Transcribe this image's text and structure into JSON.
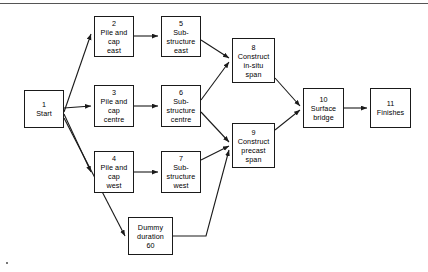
{
  "diagram": {
    "top_rule": true,
    "line_color": "#1a1a1a",
    "box_border_color": "#1a1a1a",
    "background": "#ffffff"
  },
  "nodes": [
    {
      "id": "n1",
      "number": "1",
      "label": "Start",
      "x": 24,
      "y": 90,
      "w": 40,
      "h": 38
    },
    {
      "id": "n2",
      "number": "2",
      "label": "Pile and\ncap\neast",
      "x": 94,
      "y": 16,
      "w": 40,
      "h": 41
    },
    {
      "id": "n3",
      "number": "3",
      "label": "Pile and\ncap\ncentre",
      "x": 94,
      "y": 85,
      "w": 40,
      "h": 42
    },
    {
      "id": "n4",
      "number": "4",
      "label": "Pile and\ncap\nwest",
      "x": 94,
      "y": 151,
      "w": 40,
      "h": 42
    },
    {
      "id": "n5",
      "number": "5",
      "label": "Sub-\nstructure\neast",
      "x": 161,
      "y": 16,
      "w": 40,
      "h": 41
    },
    {
      "id": "n6",
      "number": "6",
      "label": "Sub-\nstructure\ncentre",
      "x": 161,
      "y": 85,
      "w": 40,
      "h": 42
    },
    {
      "id": "n7",
      "number": "7",
      "label": "Sub-\nstructure\nwest",
      "x": 161,
      "y": 151,
      "w": 40,
      "h": 42
    },
    {
      "id": "n8",
      "number": "8",
      "label": "Construct\nin-situ\nspan",
      "x": 232,
      "y": 38,
      "w": 43,
      "h": 45
    },
    {
      "id": "n9",
      "number": "9",
      "label": "Construct\nprecast\nspan",
      "x": 232,
      "y": 123,
      "w": 43,
      "h": 45
    },
    {
      "id": "n10",
      "number": "10",
      "label": "Surface\nbridge",
      "x": 303,
      "y": 88,
      "w": 41,
      "h": 40
    },
    {
      "id": "n11",
      "number": "11",
      "label": "Finishes",
      "x": 370,
      "y": 88,
      "w": 41,
      "h": 40
    },
    {
      "id": "dummy",
      "number": "",
      "label": "Dummy\nduration\n60",
      "x": 128,
      "y": 217,
      "w": 45,
      "h": 38
    }
  ],
  "edges": [
    {
      "from": "n1",
      "to": "n2",
      "points": "64,112 91,34"
    },
    {
      "from": "n1",
      "to": "n3",
      "points": "64,108 91,106"
    },
    {
      "from": "n1",
      "to": "n4",
      "points": "64,114 91,172"
    },
    {
      "from": "n1",
      "to": "dummy",
      "points": "64,118 125,236"
    },
    {
      "from": "n2",
      "to": "n5",
      "points": "134,36 158,36"
    },
    {
      "from": "n3",
      "to": "n6",
      "points": "134,106 158,106"
    },
    {
      "from": "n4",
      "to": "n7",
      "points": "134,172 158,172"
    },
    {
      "from": "n5",
      "to": "n8",
      "points": "201,40 229,58"
    },
    {
      "from": "n6",
      "to": "n8",
      "points": "201,100 229,62"
    },
    {
      "from": "n6",
      "to": "n9",
      "points": "201,112 229,142"
    },
    {
      "from": "n7",
      "to": "n9",
      "points": "201,160 229,146"
    },
    {
      "from": "dummy",
      "to": "n9",
      "points": "173,236 206,236 229,150"
    },
    {
      "from": "n8",
      "to": "n10",
      "points": "275,78 300,106"
    },
    {
      "from": "n9",
      "to": "n10",
      "points": "275,130 300,110"
    },
    {
      "from": "n10",
      "to": "n11",
      "points": "344,108 367,108"
    }
  ]
}
